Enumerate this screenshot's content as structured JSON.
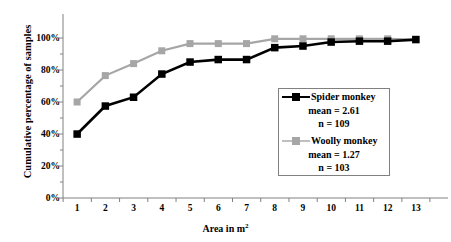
{
  "chart_data": {
    "type": "line",
    "title": "",
    "xlabel": "Area in m2",
    "xlabel_base": "Area in m",
    "xlabel_sup": "2",
    "ylabel": "Cumulative percentage of samples",
    "x": [
      1,
      2,
      3,
      4,
      5,
      6,
      7,
      8,
      9,
      10,
      11,
      12,
      13
    ],
    "xtick_labels": [
      "1",
      "2",
      "3",
      "4",
      "5",
      "6",
      "7",
      "8",
      "9",
      "10",
      "11",
      "12",
      "13"
    ],
    "ytick_labels": [
      "0%",
      "20%",
      "40%",
      "60%",
      "80%",
      "100%"
    ],
    "ytick_values": [
      0,
      20,
      40,
      60,
      80,
      100
    ],
    "xlim": [
      0.5,
      13.5
    ],
    "ylim": [
      0,
      100
    ],
    "grid": false,
    "legend_position": "center-right",
    "series": [
      {
        "name": "Spider monkey",
        "mean_label": "mean = 2.61",
        "n_label": "n = 109",
        "mean": 2.61,
        "n": 109,
        "color": "#000000",
        "marker": "square",
        "values": [
          40,
          57.5,
          63,
          77.5,
          85,
          86.5,
          86.5,
          94,
          95,
          97.5,
          98,
          98,
          99
        ]
      },
      {
        "name": "Woolly monkey",
        "mean_label": "mean = 1.27",
        "n_label": "n = 103",
        "mean": 1.27,
        "n": 103,
        "color": "#a6a6a6",
        "marker": "square",
        "values": [
          60,
          76.5,
          84,
          92,
          96.5,
          96.5,
          96.5,
          99.5,
          99.5,
          99.5,
          99.5,
          99.5,
          99
        ]
      }
    ]
  },
  "axes": {
    "axis_color": "#808080"
  }
}
